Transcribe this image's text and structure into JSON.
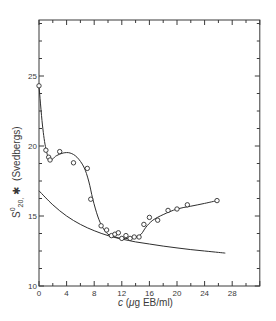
{
  "chart_data": {
    "type": "scatter",
    "title": "",
    "xlabel": "c (μg EB/ml)",
    "ylabel": "S⁰20,w (Svedbergs)",
    "xlim": [
      0,
      32
    ],
    "ylim": [
      10,
      29
    ],
    "x_ticks": [
      0,
      4,
      8,
      12,
      16,
      20,
      24,
      28
    ],
    "y_ticks": [
      10,
      15,
      20,
      25
    ],
    "x_tick_labels": [
      "0",
      "4",
      "8",
      "12",
      "16",
      "20",
      "24",
      "28"
    ],
    "y_tick_labels": [
      "10",
      "15",
      "20",
      "25"
    ],
    "grid": false,
    "legend": null,
    "series": [
      {
        "name": "Observed sedimentation coefficients",
        "style": "open circles",
        "x": [
          0.0,
          1.0,
          1.4,
          1.6,
          3.0,
          5.0,
          7.0,
          7.5,
          9.0,
          9.8,
          10.5,
          11.0,
          11.5,
          12.0,
          12.6,
          13.2,
          13.8,
          14.5,
          15.2,
          16.0,
          17.2,
          18.7,
          20.0,
          21.5,
          25.8
        ],
        "y": [
          24.3,
          19.7,
          19.2,
          19.0,
          19.6,
          18.8,
          18.4,
          16.2,
          14.3,
          14.0,
          13.6,
          13.7,
          13.8,
          13.4,
          13.6,
          13.4,
          13.5,
          13.5,
          14.4,
          14.9,
          14.7,
          15.4,
          15.5,
          15.8,
          16.1
        ]
      },
      {
        "name": "Fitted curve through data",
        "style": "solid line",
        "x": [
          0,
          0.5,
          1.0,
          1.6,
          2.5,
          3.5,
          4.5,
          5.5,
          6.5,
          7.2,
          7.8,
          8.5,
          9.2,
          10.0,
          11.0,
          12.0,
          13.0,
          14.0,
          14.8,
          15.5,
          16.5,
          18.0,
          20.0,
          22.0,
          24.0,
          25.8
        ],
        "y": [
          24.3,
          21.5,
          19.8,
          19.0,
          19.3,
          19.5,
          19.5,
          19.2,
          18.5,
          17.5,
          16.2,
          15.0,
          14.2,
          13.7,
          13.5,
          13.4,
          13.4,
          13.5,
          13.7,
          14.2,
          14.7,
          15.1,
          15.5,
          15.7,
          15.9,
          16.1
        ]
      },
      {
        "name": "Reference decreasing curve",
        "style": "solid line",
        "x": [
          0,
          2,
          4,
          6,
          8,
          10,
          12,
          14,
          16,
          18,
          20,
          22,
          24,
          26,
          27
        ],
        "y": [
          16.8,
          15.8,
          15.0,
          14.4,
          13.95,
          13.6,
          13.35,
          13.15,
          13.0,
          12.85,
          12.72,
          12.6,
          12.5,
          12.4,
          12.35
        ]
      }
    ]
  },
  "labels": {
    "y_axis": "S⁰20,w (Svedbergs)",
    "x_axis": "c (μg EB/ml)"
  }
}
